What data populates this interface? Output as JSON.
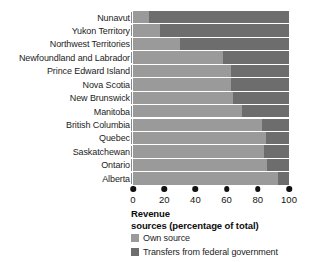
{
  "chart_data": {
    "type": "bar",
    "orientation": "horizontal",
    "stacked": true,
    "normalized": true,
    "title": "",
    "xlabel": "Revenue sources (percentage of total)",
    "ylabel": "",
    "xlim": [
      0,
      100
    ],
    "grid": false,
    "legend_position": "below-axis-left",
    "categories": [
      "Nunavut",
      "Yukon Territory",
      "Northwest Territories",
      "Newfoundland and Labrador",
      "Prince Edward Island",
      "Nova Scotia",
      "New Brunswick",
      "Manitoba",
      "British Columbia",
      "Quebec",
      "Saskatchewan",
      "Ontario",
      "Alberta"
    ],
    "series": [
      {
        "name": "Own source",
        "color": "#9a9a9a",
        "values": [
          10,
          17,
          30,
          58,
          63,
          63,
          64,
          70,
          83,
          85,
          84,
          86,
          93
        ]
      },
      {
        "name": "Transfers from federal government",
        "color": "#6d6d6d",
        "values": [
          90,
          83,
          70,
          42,
          37,
          37,
          36,
          30,
          17,
          15,
          16,
          14,
          7
        ]
      }
    ],
    "xticks": [
      0,
      20,
      40,
      60,
      80,
      100
    ],
    "xticklabels": [
      "0",
      "20",
      "40",
      "60",
      "80",
      "100"
    ]
  },
  "axis_title": {
    "line1": "Revenue",
    "line2": "sources (percentage of total)"
  },
  "legend": {
    "items": [
      {
        "label": "Own source",
        "color": "#9a9a9a"
      },
      {
        "label": "Transfers from federal government",
        "color": "#6d6d6d"
      }
    ]
  },
  "colors": {
    "own_source": "#9a9a9a",
    "transfers": "#6d6d6d",
    "text": "#1a1a1a",
    "background": "#ffffff"
  }
}
